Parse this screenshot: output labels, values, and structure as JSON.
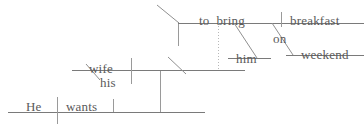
{
  "diagram": {
    "type": "reed-kellogg-sentence-diagram",
    "sentence": "He wants his wife to bring him breakfast on weekend",
    "canvas": {
      "width": 364,
      "height": 129
    },
    "ink_color": "#8c8c8c",
    "text_color": "#5a5a5a",
    "background_color": "#ffffff",
    "words": [
      {
        "id": "subject",
        "text": "He",
        "role": "subject",
        "x": 26,
        "y": 100,
        "tier": "main"
      },
      {
        "id": "verb",
        "text": "wants",
        "role": "verb",
        "x": 66,
        "y": 100,
        "tier": "main"
      },
      {
        "id": "inf-subject",
        "text": "wife",
        "role": "infinitive-subject",
        "x": 89,
        "y": 62,
        "tier": "middle"
      },
      {
        "id": "possessive",
        "text": "his",
        "role": "possessive-modifier",
        "x": 100,
        "y": 76,
        "tier": "middle"
      },
      {
        "id": "infinitive",
        "text": "to  bring",
        "role": "infinitive-verb",
        "x": 199,
        "y": 14,
        "tier": "top"
      },
      {
        "id": "indirect-object",
        "text": "him",
        "role": "indirect-object",
        "x": 236,
        "y": 52,
        "tier": "top"
      },
      {
        "id": "direct-object",
        "text": "breakfast",
        "role": "direct-object",
        "x": 290,
        "y": 14,
        "tier": "top"
      },
      {
        "id": "preposition",
        "text": "on",
        "role": "preposition",
        "x": 273,
        "y": 32,
        "tier": "top"
      },
      {
        "id": "prep-object",
        "text": "weekend",
        "role": "object-of-preposition",
        "x": 301,
        "y": 48,
        "tier": "top"
      }
    ],
    "strokes": [
      {
        "id": "main-baseline",
        "kind": "baseline",
        "x1": 8,
        "y1": 112,
        "x2": 205,
        "y2": 112
      },
      {
        "id": "subject-verb-divider",
        "kind": "divider",
        "x1": 57,
        "y1": 97,
        "x2": 57,
        "y2": 124
      },
      {
        "id": "verb-object-divider",
        "kind": "divider",
        "x1": 113,
        "y1": 99,
        "x2": 113,
        "y2": 112
      },
      {
        "id": "object-riser",
        "kind": "divider",
        "x1": 160,
        "y1": 70,
        "x2": 160,
        "y2": 112
      },
      {
        "id": "middle-baseline",
        "kind": "baseline",
        "x1": 72,
        "y1": 70,
        "x2": 245,
        "y2": 70
      },
      {
        "id": "middle-subject-divider",
        "kind": "divider",
        "x1": 131,
        "y1": 58,
        "x2": 131,
        "y2": 84
      },
      {
        "id": "possessive-slant",
        "kind": "slant",
        "x1": 86,
        "y1": 64,
        "x2": 100,
        "y2": 80
      },
      {
        "id": "pedestal-slant",
        "kind": "slant",
        "x1": 168,
        "y1": 57,
        "x2": 186,
        "y2": 74
      },
      {
        "id": "infinitive-riser",
        "kind": "divider",
        "x1": 178,
        "y1": 22,
        "x2": 178,
        "y2": 46
      },
      {
        "id": "infinitive-corner",
        "kind": "slant",
        "x1": 157,
        "y1": 5,
        "x2": 179,
        "y2": 23
      },
      {
        "id": "top-baseline",
        "kind": "baseline",
        "x1": 178,
        "y1": 23,
        "x2": 364,
        "y2": 23
      },
      {
        "id": "infinitive-dotted",
        "kind": "dotted",
        "x1": 218,
        "y1": 23,
        "x2": 218,
        "y2": 69
      },
      {
        "id": "indirect-object-slant",
        "kind": "slant",
        "x1": 234,
        "y1": 23,
        "x2": 257,
        "y2": 58
      },
      {
        "id": "indirect-object-line",
        "kind": "baseline",
        "x1": 228,
        "y1": 58,
        "x2": 271,
        "y2": 58
      },
      {
        "id": "obj-divider",
        "kind": "divider",
        "x1": 281,
        "y1": 12,
        "x2": 281,
        "y2": 27
      },
      {
        "id": "prep-slant",
        "kind": "slant",
        "x1": 272,
        "y1": 23,
        "x2": 293,
        "y2": 55
      },
      {
        "id": "prep-object-line",
        "kind": "baseline",
        "x1": 286,
        "y1": 55,
        "x2": 364,
        "y2": 55
      }
    ]
  }
}
